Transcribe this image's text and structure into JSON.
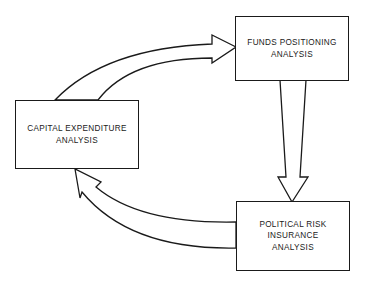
{
  "diagram": {
    "type": "cycle-flow",
    "nodes": [
      {
        "id": "funds",
        "lines": [
          "FUNDS POSITIONING",
          "ANALYSIS"
        ]
      },
      {
        "id": "political",
        "lines": [
          "POLITICAL RISK",
          "INSURANCE",
          "ANALYSIS"
        ]
      },
      {
        "id": "capital",
        "lines": [
          "CAPITAL EXPENDITURE",
          "ANALYSIS"
        ]
      }
    ],
    "edges": [
      {
        "from": "capital",
        "to": "funds",
        "style": "hollow-curved-arrow"
      },
      {
        "from": "funds",
        "to": "political",
        "style": "hollow-straight-arrow"
      },
      {
        "from": "political",
        "to": "capital",
        "style": "hollow-curved-arrow"
      }
    ],
    "colors": {
      "stroke": "#1a1a1a",
      "fill": "#ffffff"
    }
  }
}
